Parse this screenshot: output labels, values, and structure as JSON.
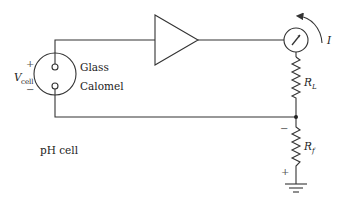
{
  "diagram": {
    "colors": {
      "line": "#333333",
      "background": "#ffffff"
    },
    "cell": {
      "voltage_symbol": "V",
      "voltage_subscript": "cell",
      "plus_sign": "+",
      "minus_sign": "−",
      "electrode_top": "Glass",
      "electrode_bottom": "Calomel",
      "caption": "pH cell"
    },
    "amplifier": {
      "symbol": "triangle-amplifier"
    },
    "meter": {
      "symbol": "ammeter",
      "current_label": "I"
    },
    "load_resistor": {
      "symbol": "R",
      "subscript": "L"
    },
    "feedback_resistor": {
      "symbol": "R",
      "subscript": "f",
      "top_sign": "−",
      "bottom_sign": "+"
    },
    "ground": {
      "symbol": "ground"
    }
  }
}
